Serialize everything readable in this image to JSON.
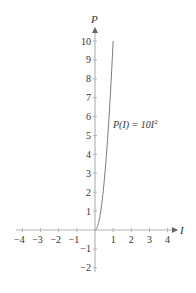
{
  "chart_data": {
    "type": "line",
    "title": "",
    "xlabel": "I",
    "ylabel": "P",
    "xlim": [
      -4,
      4
    ],
    "ylim": [
      -2,
      10
    ],
    "x_ticks": [
      -4,
      -3,
      -2,
      -1,
      1,
      2,
      3,
      4
    ],
    "y_ticks": [
      -2,
      -1,
      1,
      2,
      3,
      4,
      5,
      6,
      7,
      8,
      9,
      10
    ],
    "grid": false,
    "legend": null,
    "series": [
      {
        "name": "P(I) = 10I^2",
        "function": "P(I) = 10*I^2",
        "domain": [
          0,
          1
        ],
        "x": [
          0,
          0.1,
          0.2,
          0.3,
          0.4,
          0.5,
          0.6,
          0.7,
          0.8,
          0.9,
          1.0
        ],
        "y": [
          0,
          0.1,
          0.4,
          0.9,
          1.6,
          2.5,
          3.6,
          4.9,
          6.4,
          8.1,
          10.0
        ]
      }
    ],
    "annotations": [
      {
        "text": "P(I) = 10I²",
        "x": 1.0,
        "y": 5.6
      }
    ]
  },
  "labels": {
    "x_axis": "I",
    "y_axis": "P",
    "curve_label_prefix": "P(I) = 10I",
    "curve_label_exp": "2"
  },
  "colors": {
    "axis": "#b5b5b5",
    "curve": "#7a7a7a",
    "text": "#333333"
  }
}
